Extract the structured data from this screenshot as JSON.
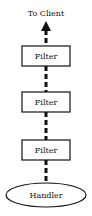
{
  "diagram": {
    "top_label": "To Client",
    "filters": [
      {
        "label": "Filter"
      },
      {
        "label": "Filter"
      },
      {
        "label": "Filter"
      }
    ],
    "handler": {
      "label": "Handler"
    },
    "colors": {
      "stroke": "#111111",
      "background": "#ffffff"
    }
  }
}
